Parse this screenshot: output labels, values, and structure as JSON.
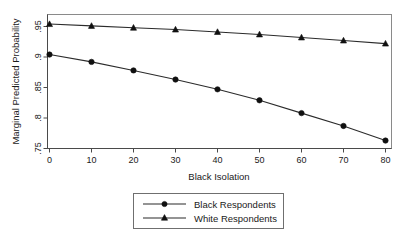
{
  "chart_data": {
    "type": "line",
    "title": "",
    "subtitle": "",
    "xlabel": "Black Isolation",
    "ylabel": "Marginal Predicted Probability",
    "x": [
      0,
      10,
      20,
      30,
      40,
      50,
      60,
      70,
      80
    ],
    "xlim": [
      0,
      80
    ],
    "ylim": [
      0.745,
      0.962
    ],
    "xticks": [
      "0",
      "10",
      "20",
      "30",
      "40",
      "50",
      "60",
      "70",
      "80"
    ],
    "yticks": [
      ".75",
      ".8",
      ".85",
      ".9",
      ".95"
    ],
    "ytick_values": [
      0.75,
      0.8,
      0.85,
      0.9,
      0.95
    ],
    "grid": false,
    "legend_position": "below-center",
    "series": [
      {
        "name": "Black Respondents",
        "marker": "circle",
        "color": "#101010",
        "values": [
          0.904,
          0.892,
          0.878,
          0.863,
          0.847,
          0.829,
          0.808,
          0.787,
          0.763
        ]
      },
      {
        "name": "White Respondents",
        "marker": "triangle",
        "color": "#101010",
        "values": [
          0.954,
          0.951,
          0.948,
          0.945,
          0.941,
          0.937,
          0.932,
          0.927,
          0.922
        ]
      }
    ]
  },
  "axes": {
    "x_title": "Black Isolation",
    "y_title": "Marginal Predicted Probability"
  },
  "legend": {
    "entries": [
      {
        "label": "Black Respondents",
        "marker": "circle-marker"
      },
      {
        "label": "White Respondents",
        "marker": "triangle-marker"
      }
    ]
  }
}
